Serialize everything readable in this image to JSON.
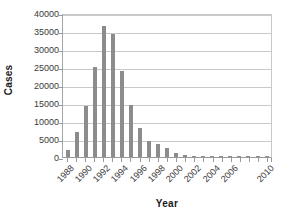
{
  "chart_data": {
    "type": "bar",
    "title": "",
    "xlabel": "Year",
    "ylabel": "Cases",
    "ylim": [
      0,
      40000
    ],
    "ytick_values": [
      0,
      5000,
      10000,
      15000,
      20000,
      25000,
      30000,
      35000,
      40000
    ],
    "ytick_labels": [
      "0",
      "5000",
      "10000",
      "15000",
      "20000",
      "25000",
      "30000",
      "35000",
      "40000"
    ],
    "grid": true,
    "legend": null,
    "categories": [
      "1988",
      "1989",
      "1990",
      "1991",
      "1992",
      "1993",
      "1994",
      "1995",
      "1996",
      "1997",
      "1998",
      "1999",
      "2000",
      "2001",
      "2002",
      "2003",
      "2004",
      "2005",
      "2006",
      "2007",
      "2008",
      "2009",
      "2010"
    ],
    "xtick_labels_shown": [
      "1988",
      "1990",
      "1992",
      "1994",
      "1996",
      "1998",
      "2000",
      "2002",
      "2004",
      "2006",
      "2010"
    ],
    "values": [
      2000,
      7000,
      14200,
      24900,
      36500,
      34300,
      23900,
      14400,
      8000,
      4500,
      3500,
      2600,
      1200,
      600,
      350,
      120,
      60,
      40,
      30,
      20,
      15,
      10,
      5
    ],
    "bar_color": "#8c8c8c",
    "grid_color": "#c9c9c9",
    "axis_color": "#9a9a9a",
    "background": "#ffffff"
  }
}
